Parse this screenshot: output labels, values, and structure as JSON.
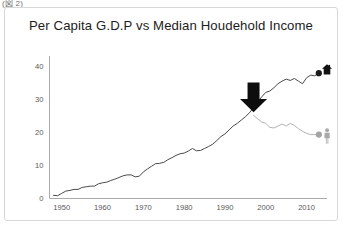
{
  "clipped_caption": "(図 2)",
  "figure": {
    "title": "Per Capita G.D.P vs Median Houdehold Income"
  },
  "colors": {
    "gdp_line": "#4a4a4c",
    "income_line": "#b2b2b4",
    "gdp_marker": "#1b1b1b",
    "income_marker": "#a4a4a6",
    "house_icon": "#111111",
    "person_icon": "#a9a9ab",
    "arrow": "#0d0d0d",
    "axis": "#a9a9ab",
    "tick_text": "#58585a",
    "card_border": "#d8d8d8",
    "background": "#ffffff"
  },
  "icons": {
    "house": "house-icon",
    "person": "person-icon",
    "arrow": "down-arrow-annotation-icon"
  },
  "chart_data": {
    "type": "line",
    "title": "Per Capita G.D.P vs Median Houdehold Income",
    "xlabel": "",
    "ylabel": "",
    "xlim": [
      1947,
      2015
    ],
    "ylim": [
      0,
      43
    ],
    "xticks": [
      1950,
      1960,
      1970,
      1980,
      1990,
      2000,
      2010
    ],
    "yticks": [
      0,
      10,
      20,
      30,
      40
    ],
    "grid": false,
    "legend": "none",
    "annotations": [
      {
        "name": "divergence-arrow",
        "type": "down-arrow",
        "x": 1997,
        "y_top": 35,
        "y_tip": 26,
        "note": "marks the point where the two series diverge"
      },
      {
        "name": "gdp-endpoint-house-icon",
        "type": "icon",
        "icon": "house-icon",
        "x": 2015,
        "y": 39
      },
      {
        "name": "income-endpoint-person-icon",
        "type": "icon",
        "icon": "person-icon",
        "x": 2015,
        "y": 19
      }
    ],
    "series": [
      {
        "name": "Per Capita G.D.P",
        "color": "#4a4a4c",
        "endpoint_marker": {
          "x": 2013,
          "y": 37.8
        },
        "x": [
          1948,
          1949,
          1950,
          1951,
          1952,
          1953,
          1954,
          1955,
          1956,
          1957,
          1958,
          1959,
          1960,
          1961,
          1962,
          1963,
          1964,
          1965,
          1966,
          1967,
          1968,
          1969,
          1970,
          1971,
          1972,
          1973,
          1974,
          1975,
          1976,
          1977,
          1978,
          1979,
          1980,
          1981,
          1982,
          1983,
          1984,
          1985,
          1986,
          1987,
          1988,
          1989,
          1990,
          1991,
          1992,
          1993,
          1994,
          1995,
          1996,
          1997,
          1998,
          1999,
          2000,
          2001,
          2002,
          2003,
          2004,
          2005,
          2006,
          2007,
          2008,
          2009,
          2010,
          2011,
          2012,
          2013
        ],
        "values": [
          0.8,
          0.7,
          1.4,
          2.1,
          2.3,
          2.6,
          2.6,
          3.2,
          3.4,
          3.6,
          3.6,
          4.3,
          4.6,
          4.8,
          5.3,
          5.7,
          6.2,
          6.7,
          7.0,
          7.0,
          6.4,
          6.6,
          7.9,
          8.8,
          9.6,
          10.4,
          10.5,
          10.8,
          11.6,
          12.2,
          12.9,
          13.4,
          13.6,
          14.2,
          15.0,
          14.3,
          14.4,
          15.0,
          15.6,
          16.3,
          17.4,
          18.6,
          19.4,
          20.6,
          21.8,
          22.6,
          23.6,
          24.6,
          25.8,
          27.4,
          29.0,
          30.6,
          32.0,
          32.4,
          33.4,
          34.6,
          35.4,
          36.0,
          35.6,
          36.2,
          35.4,
          34.6,
          36.4,
          37.2,
          37.0,
          37.8
        ]
      },
      {
        "name": "Median Household Income",
        "color": "#b2b2b4",
        "endpoint_marker": {
          "x": 2013,
          "y": 19.2
        },
        "x": [
          1997,
          1998,
          1999,
          2000,
          2001,
          2002,
          2003,
          2004,
          2005,
          2006,
          2007,
          2008,
          2009,
          2010,
          2011,
          2012,
          2013
        ],
        "values": [
          25.0,
          24.0,
          23.0,
          22.6,
          21.4,
          21.2,
          21.8,
          22.4,
          21.8,
          22.6,
          22.0,
          21.0,
          20.2,
          19.6,
          19.2,
          19.2,
          19.2
        ]
      }
    ]
  }
}
